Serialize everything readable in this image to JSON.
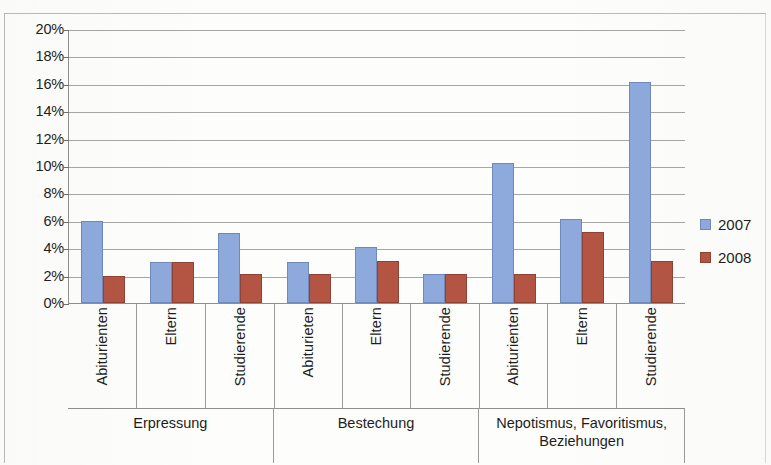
{
  "chart_data": {
    "type": "bar",
    "title": "",
    "subtitle": "",
    "xlabel": "",
    "ylabel": "",
    "ylim": [
      0,
      20
    ],
    "ytick_labels": [
      "20%",
      "18%",
      "16%",
      "14%",
      "12%",
      "10%",
      "8%",
      "6%",
      "4%",
      "2%",
      "0%"
    ],
    "ytick_values": [
      20,
      18,
      16,
      14,
      12,
      10,
      8,
      6,
      4,
      2,
      0
    ],
    "grid": true,
    "legend_position": "right",
    "value_suffix": "%",
    "groups": [
      {
        "label": "Erpressung",
        "categories": [
          "Abiturienten",
          "Eltern",
          "Studierende"
        ]
      },
      {
        "label": "Bestechung",
        "categories": [
          "Abiturieten",
          "Eltern",
          "Studierende"
        ]
      },
      {
        "label": "Nepotismus, Favoritismus, Beziehungen",
        "categories": [
          "Abiturienten",
          "Eltern",
          "Studierende"
        ]
      }
    ],
    "categories": [
      "Abiturienten",
      "Eltern",
      "Studierende",
      "Abiturieten",
      "Eltern",
      "Studierende",
      "Abiturienten",
      "Eltern",
      "Studierende"
    ],
    "series": [
      {
        "name": "2007",
        "color": "#8ea9dc",
        "values": [
          6.0,
          3.0,
          5.1,
          3.0,
          4.1,
          2.1,
          10.2,
          6.1,
          16.1
        ]
      },
      {
        "name": "2008",
        "color": "#b35542",
        "values": [
          2.0,
          3.0,
          2.1,
          2.1,
          3.1,
          2.1,
          2.1,
          5.2,
          3.1
        ]
      }
    ]
  },
  "legend": {
    "items": [
      {
        "label": "2007",
        "color": "#8ea9dc"
      },
      {
        "label": "2008",
        "color": "#b35542"
      }
    ]
  }
}
